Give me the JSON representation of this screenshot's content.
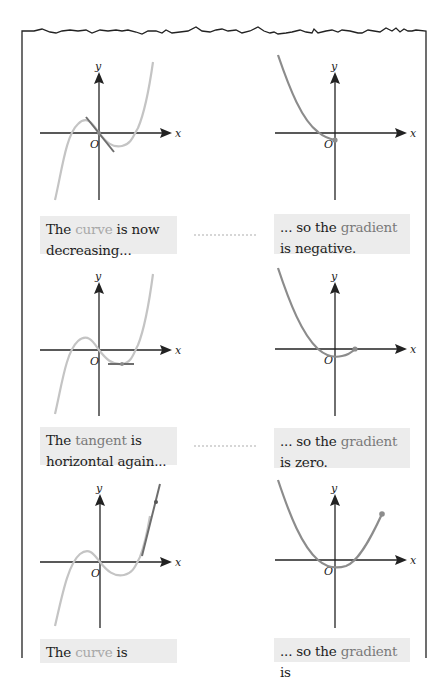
{
  "colors": {
    "frame": "#222222",
    "axis": "#222222",
    "curve": "#c4c4c4",
    "gradient_curve": "#8c8c8c",
    "tangent": "#6e6e6e",
    "caption_bg": "#ececec",
    "caption_text": "#1e1e1e",
    "highlight_curve": "#a8a8a8",
    "highlight_gradient": "#7a7a7a"
  },
  "axes": {
    "x_label": "x",
    "y_label": "y",
    "origin_label": "O"
  },
  "rows": [
    {
      "left": {
        "graph": "cubic curve with tangent of negative slope at the origin",
        "caption": {
          "pre": "The ",
          "highlight": "curve",
          "post": " is now decreasing..."
        }
      },
      "right": {
        "graph": "gradient function traced down to a negative value at x = 0",
        "caption": {
          "pre": "... so the ",
          "highlight": "gradient",
          "post": " is negative."
        }
      }
    },
    {
      "left": {
        "graph": "cubic curve with horizontal tangent at its local minimum",
        "caption": {
          "pre": "The ",
          "highlight": "tangent",
          "post": " is horizontal again..."
        }
      },
      "right": {
        "graph": "gradient function traced back up to zero on the x-axis",
        "caption": {
          "pre": "... so the ",
          "highlight": "gradient",
          "post": " is zero."
        }
      }
    },
    {
      "left": {
        "graph": "cubic curve with steep positive tangent on the right",
        "caption": {
          "pre": "The ",
          "highlight": "curve",
          "post": " is"
        }
      },
      "right": {
        "graph": "gradient function (parabola) traced up to a positive value",
        "caption": {
          "pre": "... so the ",
          "highlight": "gradient",
          "post": " is"
        }
      }
    }
  ]
}
